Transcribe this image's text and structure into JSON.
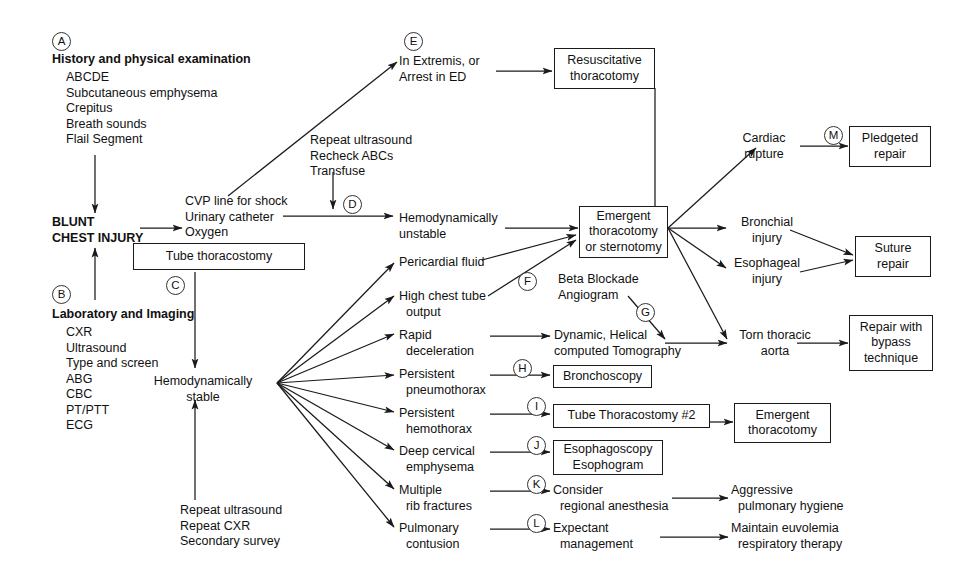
{
  "diagram": {
    "stroke_color": "#1a1a1a",
    "text_color": "#111111",
    "background": "#ffffff"
  },
  "keys": {
    "a": "A",
    "b": "B",
    "c": "C",
    "d": "D",
    "e": "E",
    "f": "F",
    "g": "G",
    "h": "H",
    "i": "I",
    "j": "J",
    "k": "K",
    "l": "L",
    "m": "M"
  },
  "nodes": {
    "history_heading": "History and physical examination",
    "history_items": "ABCDE\nSubcutaneous emphysema\nCrepitus\nBreath sounds\nFlail Segment",
    "blunt_chest_injury": "BLUNT\nCHEST INJURY",
    "lab_heading": "Laboratory and Imaging",
    "lab_items": "CXR\nUltrasound\nType and screen\nABG\nCBC\nPT/PTT\nECG",
    "initial_measures": "CVP line for shock\nUrinary catheter\nOxygen",
    "tube_thoracostomy": "Tube thoracostomy",
    "repeat_block": "Repeat ultrasound\nRecheck ABCs\nTransfuse",
    "in_extremis": "In Extremis, or\nArrest in ED",
    "resuscitative_thoracotomy": "Resuscitative\nthoracotomy",
    "hemodynamically_unstable": "Hemodynamically\nunstable",
    "emergent_thoracotomy_sternotomy": "Emergent\nthoracotomy\nor sternotomy",
    "hemodynamically_stable": "Hemodynamically\nstable",
    "repeat_survey": "Repeat ultrasound\nRepeat CXR\nSecondary survey",
    "pericardial_fluid": "Pericardial fluid",
    "high_chest_tube_output": "High chest tube\n  output",
    "rapid_deceleration": "Rapid\n  deceleration",
    "persistent_pneumothorax": "Persistent\n  pneumothorax",
    "persistent_hemothorax": "Persistent\n  hemothorax",
    "deep_cervical_emphysema": "Deep cervical\n  emphysema",
    "multiple_rib_fractures": "Multiple\n  rib fractures",
    "pulmonary_contusion": "Pulmonary\n  contusion",
    "beta_blockade_angiogram": "Beta Blockade\nAngiogram",
    "dynamic_helical_ct": "Dynamic, Helical\ncomputed Tomography",
    "bronchoscopy": "Bronchoscopy",
    "tube_thoracostomy_2": "Tube Thoracostomy #2",
    "esophagoscopy_esophogram": "Esophagoscopy\nEsophogram",
    "consider_regional_anesthesia": "Consider\n  regional anesthesia",
    "expectant_management": "Expectant\n  management",
    "cardiac_rupture": "Cardiac\nrupture",
    "bronchial_injury": "Bronchial\ninjury",
    "esophageal_injury": "Esophageal\ninjury",
    "torn_thoracic_aorta": "Torn thoracic\naorta",
    "pledgeted_repair": "Pledgeted\nrepair",
    "suture_repair": "Suture\nrepair",
    "repair_with_bypass": "Repair with\nbypass\ntechnique",
    "emergent_thoracotomy_box": "Emergent\nthoracotomy",
    "aggressive_pulmonary_hygiene": "Aggressive\n  pulmonary hygiene",
    "maintain_euvolemia": "Maintain euvolemia\n  respiratory therapy"
  }
}
